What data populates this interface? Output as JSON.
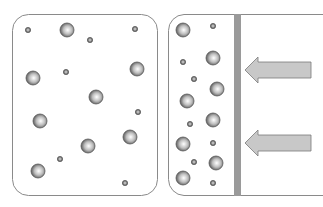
{
  "diagram": {
    "colors": {
      "outline": "#8a8a8a",
      "piston": "#9a9a9a",
      "arrow_fill": "#c8c8c8",
      "arrow_stroke": "#7a7a7a",
      "particle_dark": "#5a5a5a",
      "particle_light": "#ffffff"
    },
    "left_container": {
      "label": "uncompressed",
      "large_particles": [
        [
          67,
          30
        ],
        [
          33,
          78
        ],
        [
          137,
          69
        ],
        [
          96,
          97
        ],
        [
          40,
          121
        ],
        [
          130,
          137
        ],
        [
          88,
          146
        ],
        [
          38,
          171
        ]
      ],
      "small_particles": [
        [
          28,
          30
        ],
        [
          90,
          40
        ],
        [
          135,
          29
        ],
        [
          66,
          72
        ],
        [
          138,
          112
        ],
        [
          60,
          159
        ],
        [
          125,
          183
        ]
      ]
    },
    "right_container": {
      "label": "compressed",
      "large_particles": [
        [
          183,
          30
        ],
        [
          213,
          58
        ],
        [
          217,
          89
        ],
        [
          187,
          101
        ],
        [
          213,
          120
        ],
        [
          183,
          144
        ],
        [
          216,
          163
        ],
        [
          183,
          178
        ]
      ],
      "small_particles": [
        [
          213,
          26
        ],
        [
          183,
          62
        ],
        [
          194,
          79
        ],
        [
          190,
          124
        ],
        [
          213,
          143
        ],
        [
          194,
          162
        ],
        [
          213,
          183
        ]
      ],
      "piston": {
        "x": 234,
        "width": 7
      },
      "arrows": [
        {
          "name": "force-arrow-top",
          "y": 70
        },
        {
          "name": "force-arrow-bottom",
          "y": 143
        }
      ]
    }
  }
}
